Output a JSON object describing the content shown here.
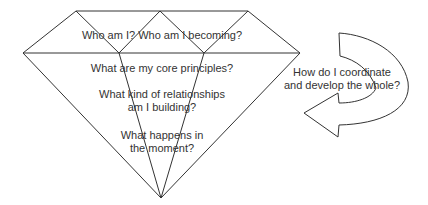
{
  "diagram": {
    "type": "diamond-with-curved-arrow",
    "line_color": "#333333",
    "text_color": "#333333",
    "background": "#ffffff",
    "diamond": {
      "levels": [
        {
          "id": "crown",
          "lines": [
            "Who am I? Who am I becoming?"
          ]
        },
        {
          "id": "principles",
          "lines": [
            "What are my core principles?"
          ]
        },
        {
          "id": "relationships",
          "lines": [
            "What kind of relationships",
            "am I building?"
          ]
        },
        {
          "id": "moment",
          "lines": [
            "What happens in",
            "the moment?"
          ]
        }
      ]
    },
    "arrow": {
      "direction": "curving-clockwise-pointing-left",
      "lines": [
        "How do I coordinate",
        "and develop the whole?"
      ]
    }
  }
}
